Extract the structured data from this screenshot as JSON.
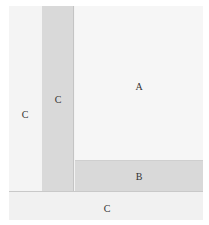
{
  "diagram": {
    "regions": [
      {
        "id": "c-left",
        "label": "C"
      },
      {
        "id": "c-strip",
        "label": "C"
      },
      {
        "id": "a",
        "label": "A"
      },
      {
        "id": "b",
        "label": "B"
      },
      {
        "id": "c-bottom",
        "label": "C"
      }
    ]
  }
}
